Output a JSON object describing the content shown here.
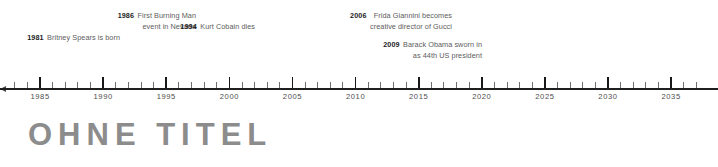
{
  "title": "OHNE TITEL",
  "colors": {
    "axis": "#1f1f1f",
    "major_tick": "#181818",
    "minor_tick": "#6f6f6f",
    "year_label": "#4e4e4e",
    "event_year": "#1c1c1c",
    "event_text": "#5d5d5d",
    "title": "#8c8c8c",
    "background": "#ffffff"
  },
  "chart_data": {
    "type": "timeline",
    "title": "OHNE TITEL",
    "xlabel": "",
    "ylabel": "",
    "axis": {
      "start_year": 1983,
      "end_year": 2037,
      "major_interval": 5,
      "minor_interval": 1,
      "tick_labels": [
        "1985",
        "1990",
        "1995",
        "2000",
        "2005",
        "2010",
        "2015",
        "2020",
        "2025",
        "2030",
        "2035"
      ],
      "tick_values": [
        1985,
        1990,
        1995,
        2000,
        2005,
        2010,
        2015,
        2020,
        2025,
        2030,
        2035
      ],
      "grid": false,
      "arrow_at_start": true
    },
    "events": [
      {
        "year": 1981,
        "year_label": "1981",
        "lines": [
          "Britney Spears is born"
        ],
        "text": "Britney Spears is born"
      },
      {
        "year": 1986,
        "year_label": "1986",
        "lines": [
          "First Burning Man",
          "event in Nevada"
        ],
        "text": "First Burning Man event in Nevada"
      },
      {
        "year": 1994,
        "year_label": "1994",
        "lines": [
          "Kurt Cobain dies"
        ],
        "text": "Kurt Cobain dies"
      },
      {
        "year": 2006,
        "year_label": "2006",
        "lines": [
          "Frida Giannini becomes",
          "creative director of Gucci"
        ],
        "text": "Frida Giannini becomes creative director of Gucci"
      },
      {
        "year": 2009,
        "year_label": "2009",
        "lines": [
          "Barack Obama sworn in",
          "as 44th US president"
        ],
        "text": "Barack Obama sworn in as 44th US president"
      }
    ]
  }
}
